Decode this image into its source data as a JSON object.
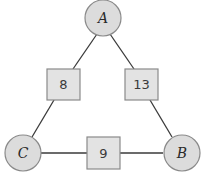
{
  "diagram": {
    "type": "weighted-triangle-graph",
    "nodes": [
      {
        "id": "A",
        "label": "A",
        "position": "top"
      },
      {
        "id": "B",
        "label": "B",
        "position": "bottom-right"
      },
      {
        "id": "C",
        "label": "C",
        "position": "bottom-left"
      }
    ],
    "edges": [
      {
        "from": "A",
        "to": "C",
        "weight": "8"
      },
      {
        "from": "A",
        "to": "B",
        "weight": "13"
      },
      {
        "from": "C",
        "to": "B",
        "weight": "9"
      }
    ]
  }
}
